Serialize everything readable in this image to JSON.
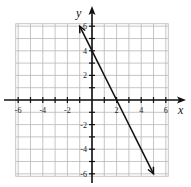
{
  "chart_data": {
    "type": "line",
    "title": "",
    "xlabel": "x",
    "ylabel": "y",
    "xlim": [
      -6,
      6
    ],
    "ylim": [
      -6,
      6
    ],
    "grid": true,
    "x_ticks": [
      "-6",
      "-4",
      "-2",
      "2",
      "4",
      "6"
    ],
    "y_ticks": [
      "6",
      "4",
      "2",
      "-2",
      "-4",
      "-6"
    ],
    "series": [
      {
        "name": "line",
        "equation": "y = -2x + 4",
        "x": [
          -1,
          0,
          2,
          5
        ],
        "y": [
          6,
          4,
          0,
          -6
        ],
        "arrows_both_ends": true
      }
    ]
  },
  "axes": {
    "x_label": "x",
    "y_label": "y"
  },
  "colors": {
    "grid": "#b8b8b8",
    "axis": "#111111",
    "line": "#111111"
  }
}
